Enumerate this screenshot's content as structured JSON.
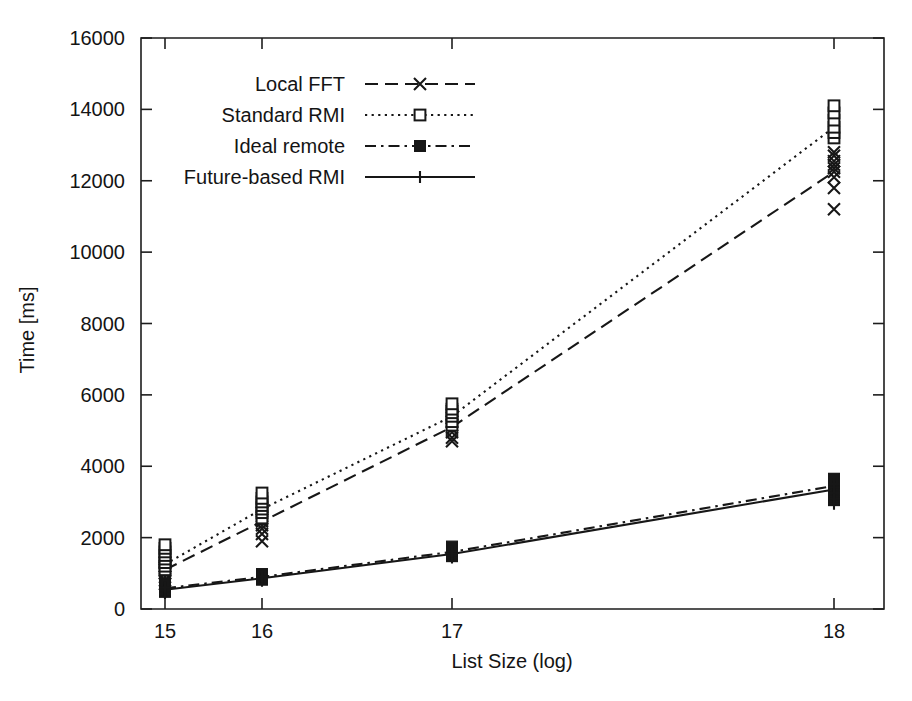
{
  "chart_data": {
    "type": "line",
    "title": "",
    "subtitle": "",
    "xlabel": "List Size (log)",
    "ylabel": "Time [ms]",
    "x": [
      15,
      16,
      17,
      18
    ],
    "xtick_labels": [
      "15",
      "16",
      "17",
      "18"
    ],
    "xtick_positions_px": [
      165,
      262,
      452,
      834
    ],
    "ytick_labels": [
      "0",
      "2000",
      "4000",
      "6000",
      "8000",
      "10000",
      "12000",
      "14000",
      "16000"
    ],
    "ytick_values": [
      0,
      2000,
      4000,
      6000,
      8000,
      10000,
      12000,
      14000,
      16000
    ],
    "ylim": [
      0,
      16000
    ],
    "grid": false,
    "legend_position": "upper-left-inside",
    "axis_note": "x axis tick spacing is non-uniform in the rendered figure",
    "series": [
      {
        "name": "Local FFT",
        "line_style": "dashed",
        "marker": "x",
        "values": [
          1100,
          2450,
          5100,
          12250
        ],
        "scatter": [
          {
            "x": 15,
            "y": [
              700,
              800,
              900,
              1000,
              1050,
              1100,
              1150,
              1200,
              1300,
              1450
            ]
          },
          {
            "x": 16,
            "y": [
              1900,
              2100,
              2250,
              2350,
              2450,
              2500,
              2600,
              2700,
              2850
            ]
          },
          {
            "x": 17,
            "y": [
              4700,
              4800,
              4950,
              5050,
              5150,
              5250,
              5350,
              5450,
              5550
            ]
          },
          {
            "x": 18,
            "y": [
              11200,
              11800,
              12100,
              12250,
              12350,
              12450,
              12550,
              12700,
              12800
            ]
          }
        ]
      },
      {
        "name": "Standard RMI",
        "line_style": "dotted",
        "marker": "open-square",
        "values": [
          1250,
          2800,
          5400,
          13500
        ],
        "scatter": [
          {
            "x": 15,
            "y": [
              1100,
              1200,
              1300,
              1400,
              1500,
              1600,
              1700,
              1800
            ]
          },
          {
            "x": 16,
            "y": [
              2550,
              2700,
              2800,
              2900,
              3000,
              3100,
              3250
            ]
          },
          {
            "x": 17,
            "y": [
              5150,
              5250,
              5400,
              5500,
              5600,
              5750
            ]
          },
          {
            "x": 18,
            "y": [
              13200,
              13350,
              13500,
              13700,
              13900,
              14100
            ]
          }
        ]
      },
      {
        "name": "Ideal remote",
        "line_style": "dash-dot",
        "marker": "filled-square",
        "values": [
          580,
          900,
          1600,
          3450
        ],
        "scatter": [
          {
            "x": 15,
            "y": [
              480,
              520,
              560,
              600,
              640,
              700
            ]
          },
          {
            "x": 16,
            "y": [
              820,
              860,
              900,
              940,
              980
            ]
          },
          {
            "x": 17,
            "y": [
              1480,
              1550,
              1600,
              1680,
              1750
            ]
          },
          {
            "x": 18,
            "y": [
              3050,
              3200,
              3350,
              3450,
              3550,
              3650
            ]
          }
        ]
      },
      {
        "name": "Future-based RMI",
        "line_style": "solid",
        "marker": "plus",
        "values": [
          540,
          860,
          1540,
          3350
        ],
        "scatter": [
          {
            "x": 15,
            "y": [
              450,
              490,
              530,
              570,
              610
            ]
          },
          {
            "x": 16,
            "y": [
              790,
              830,
              870,
              910
            ]
          },
          {
            "x": 17,
            "y": [
              1440,
              1500,
              1560,
              1620
            ]
          },
          {
            "x": 18,
            "y": [
              2950,
              3100,
              3250,
              3400,
              3500
            ]
          }
        ]
      }
    ]
  },
  "legend": {
    "items": [
      {
        "label": "Local FFT"
      },
      {
        "label": "Standard RMI"
      },
      {
        "label": "Ideal remote"
      },
      {
        "label": "Future-based RMI"
      }
    ]
  },
  "colors": {
    "ink": "#171717",
    "background": "#ffffff"
  }
}
